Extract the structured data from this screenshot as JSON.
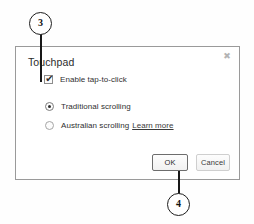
{
  "dialog": {
    "title": "Touchpad",
    "close_icon": "close-icon",
    "close_glyph": "✖",
    "checkbox": {
      "label": "Enable tap-to-click",
      "checked": true,
      "tick_glyph": "✔"
    },
    "scrolling_options": [
      {
        "label": "Traditional scrolling",
        "selected": true
      },
      {
        "label": "Australian scrolling",
        "selected": false,
        "link_label": "Learn more"
      }
    ],
    "buttons": {
      "ok_label": "OK",
      "cancel_label": "Cancel"
    }
  },
  "callouts": [
    {
      "number": "3"
    },
    {
      "number": "4"
    }
  ],
  "colors": {
    "page_background": "#fefefe",
    "dialog_background": "#ffffff",
    "dialog_border": "#9a9a9a",
    "text": "#2f2f2f",
    "title_text": "#2b2b2b",
    "callout_stroke": "#1d1d1d",
    "leader_line": "#181818",
    "primary_button_border": "#6d6d6d",
    "secondary_button_border": "#cfcfcf",
    "close_icon": "#b4b4b4"
  }
}
